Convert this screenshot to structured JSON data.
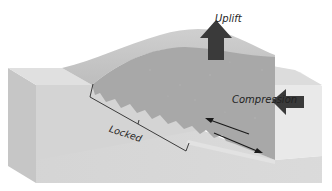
{
  "diagram": {
    "type": "block-diagram",
    "labels": {
      "uplift": "Uplift",
      "compression": "Compression",
      "locked": "Locked"
    },
    "arrows": [
      {
        "name": "uplift-arrow",
        "direction": "up",
        "label": "Uplift"
      },
      {
        "name": "compression-arrow",
        "direction": "left",
        "label": "Compression"
      },
      {
        "name": "hanging-wall-slip-arrow",
        "direction": "up-left"
      },
      {
        "name": "footwall-slip-arrow",
        "direction": "down-right"
      }
    ],
    "colors": {
      "background": "#ffffff",
      "block_front": "#d3d3d3",
      "block_side": "#c4c4c4",
      "block_top": "#dedede",
      "hanging_wall": "#a9a9a9",
      "uplift_surface": "#c9c9c9",
      "arrow_fill": "#3a3a3a",
      "line": "#2a2a2a"
    }
  }
}
